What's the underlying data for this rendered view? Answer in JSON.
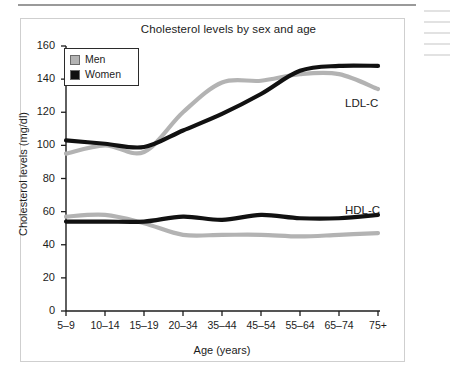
{
  "figure": {
    "title": "Cholesterol levels by sex and age",
    "xlabel": "Age (years)",
    "ylabel": "Cholesterol levels (mg/dl)",
    "legend": {
      "items": [
        {
          "label": "Men",
          "color": "#b3b3b3"
        },
        {
          "label": "Women",
          "color": "#111111"
        }
      ]
    },
    "annotations": [
      {
        "text": "LDL-C"
      },
      {
        "text": "HDL-C"
      }
    ]
  },
  "chart_data": {
    "type": "line",
    "title": "Cholesterol levels by sex and age",
    "xlabel": "Age (years)",
    "ylabel": "Cholesterol levels (mg/dl)",
    "categories": [
      "5–9",
      "10–14",
      "15–19",
      "20–34",
      "35–44",
      "45–54",
      "55–64",
      "65–74",
      "75+"
    ],
    "ylim": [
      0,
      160
    ],
    "yticks": [
      0,
      20,
      40,
      60,
      80,
      100,
      120,
      140,
      160
    ],
    "grid": false,
    "legend_position": "upper-left",
    "series": [
      {
        "name": "Men LDL-C",
        "measure": "LDL-C",
        "sex": "Men",
        "color": "#b3b3b3",
        "values": [
          95,
          100,
          96,
          120,
          138,
          139,
          143,
          143,
          134
        ]
      },
      {
        "name": "Women LDL-C",
        "measure": "LDL-C",
        "sex": "Women",
        "color": "#111111",
        "values": [
          103,
          101,
          99,
          109,
          119,
          131,
          145,
          148,
          148
        ]
      },
      {
        "name": "Men HDL-C",
        "measure": "HDL-C",
        "sex": "Men",
        "color": "#b3b3b3",
        "values": [
          57,
          58,
          53,
          46,
          46,
          46,
          45,
          46,
          47
        ]
      },
      {
        "name": "Women HDL-C",
        "measure": "HDL-C",
        "sex": "Women",
        "color": "#111111",
        "values": [
          54,
          54,
          54,
          57,
          55,
          58,
          56,
          56,
          58
        ]
      }
    ]
  }
}
